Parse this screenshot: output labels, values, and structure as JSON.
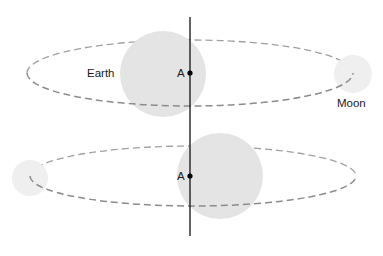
{
  "diagram": {
    "labels": {
      "earth": "Earth",
      "moon": "Moon",
      "point_top": "A",
      "point_bottom": "A"
    },
    "colors": {
      "earth_fill": "#e4e4e4",
      "moon_fill": "#efefef",
      "orbit_stroke": "#9a9a9a",
      "axis_stroke": "#111111"
    },
    "panels": [
      {
        "name": "top",
        "earth": {
          "cx": 163,
          "cy": 74,
          "r": 43
        },
        "moon": {
          "cx": 353,
          "cy": 74,
          "r": 19
        },
        "orbit": {
          "cx": 190,
          "cy": 73,
          "rx": 163,
          "ry": 33
        },
        "point_a": {
          "x": 190,
          "y": 73
        }
      },
      {
        "name": "bottom",
        "earth": {
          "cx": 220,
          "cy": 176,
          "r": 43
        },
        "moon": {
          "cx": 30,
          "cy": 178,
          "r": 18
        },
        "orbit": {
          "cx": 193,
          "cy": 176,
          "rx": 163,
          "ry": 30
        },
        "point_a": {
          "x": 190,
          "y": 176
        }
      }
    ],
    "axis": {
      "x": 190,
      "y1": 17,
      "y2": 236
    }
  }
}
